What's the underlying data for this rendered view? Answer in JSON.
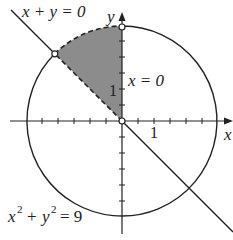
{
  "diagram": {
    "type": "region-plot",
    "labels": {
      "line": "x + y = 0",
      "y_axis_line": "x = 0",
      "circle_eq_base_x": "x",
      "circle_eq_base_y": "y",
      "circle_eq_exp": "2",
      "circle_eq_rest": "= 9",
      "plus": "+",
      "x_axis": "x",
      "y_axis": "y",
      "tick_x": "1",
      "tick_y": "1"
    },
    "circle": {
      "center": [
        0,
        0
      ],
      "radius": 3
    },
    "line": {
      "equation": "x + y = 0"
    },
    "shaded_region": "between x + y = 0, x = 0 and circle x^2 + y^2 = 9 in second quadrant",
    "points": [
      {
        "name": "intersection-line-circle",
        "coords": "(-3/√2, 3/√2)",
        "style": "open"
      },
      {
        "name": "circle-top",
        "coords": "(0, 3)",
        "style": "open"
      },
      {
        "name": "origin",
        "coords": "(0, 0)",
        "style": "open"
      }
    ],
    "colors": {
      "shade": "#8a8a8a",
      "stroke": "#222222"
    }
  }
}
